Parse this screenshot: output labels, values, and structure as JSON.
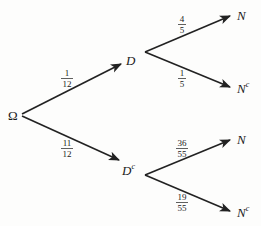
{
  "diagram": {
    "type": "probability-tree",
    "root": {
      "label": "Ω"
    },
    "level1": [
      {
        "label": "D",
        "sup": "",
        "probability": {
          "num": "1",
          "den": "12"
        }
      },
      {
        "label": "D",
        "sup": "c",
        "probability": {
          "num": "11",
          "den": "12"
        }
      }
    ],
    "level2": {
      "D": [
        {
          "label": "N",
          "sup": "",
          "probability": {
            "num": "4",
            "den": "5"
          }
        },
        {
          "label": "N",
          "sup": "c",
          "probability": {
            "num": "1",
            "den": "5"
          }
        }
      ],
      "Dc": [
        {
          "label": "N",
          "sup": "",
          "probability": {
            "num": "36",
            "den": "55"
          }
        },
        {
          "label": "N",
          "sup": "c",
          "probability": {
            "num": "19",
            "den": "55"
          }
        }
      ]
    },
    "colors": {
      "line": "#222222",
      "text": "#1a1a1a",
      "background": "#fdfdfc"
    }
  }
}
